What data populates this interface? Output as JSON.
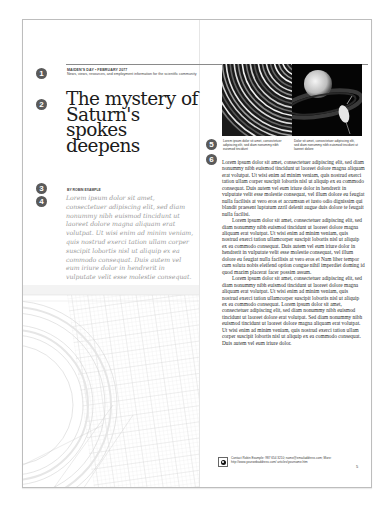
{
  "masthead": {
    "issue": "MAIDEN'S DAY • FEBRUARY 2077",
    "tagline": "News, views, resources, and employment information for the scientific community"
  },
  "article": {
    "title": "The mystery of Saturn's spokes deepens",
    "byline": "BY ROBIN EXAMPLE",
    "deck": "Lorem ipsum dolor sit amet, consectetuer adipiscing elit, sed diam nonummy nibh euismod tincidunt ut laoreet dolore magna aliquam erat volutpat. Ut wisi enim ad minim veniam, quis nostrud exerci tation ullam corper suscipit lobortis nisl ut aliquip ex ea commodo consequat. Duis autem vel eum iriure dolor in hendrerit in vulputate velit esse molestie consequat.",
    "body": [
      "Lorem ipsum dolor sit amet, consectetuer adipiscing elit, sed diam nonummy nibh euismod tincidunt ut laoreet dolore magna aliquam erat volutpat. Ut wisi enim ad minim veniam, quis nostrud exerci tation ullam corper suscipit lobortis nisl ut aliquip ex ea commodo consequat. Duis autem vel eum iriure dolor in hendrerit in vulputate velit esse molestie consequat, vel illum dolore eu feugiat nulla facilisis at vero eros et accumsan et iusto odio dignissim qui blandit praesent luptatum zzril delenit augue duis dolore te feugait nulla facilisi.",
      "Lorem ipsum dolor sit amet, consectetuer adipiscing elit, sed diam nonummy nibh euismod tincidunt ut laoreet dolore magna aliquam erat volutpat. Ut wisi enim ad minim veniam, quis nostrud exerci tation ullamcorper suscipit lobortis nisl ut aliquip ex ea commodo consequat. Duis autem vel eum iriure dolor in hendrerit in vulputate velit esse molestie consequat, vel illum dolore eu feugiat nulla facilisis at vero eros et Nam liber tempor cum soluta nobis eleifend option congue nihil imperdiet doming id quod mazim placerat facer possim assum.",
      "Lorem ipsum dolor sit amet, consectetuer adipiscing elit, sed diam nonummy nibh euismod tincidunt ut laoreet dolore magna aliquam erat volutpat. Ut wisi enim ad minim veniam, quis nostrud exerci tation ullamcorper suscipit lobortis nisl ut aliquip ex ea commodo consequat. Lorem ipsum dolor sit amet, consectetuer adipiscing elit, sed diam nonummy nibh euismod tincidunt ut laoreet dolore erat volutpat. Sed diam nonummy nibh euismod tincidunt ut laoreet dolore magna aliquam erat volutpat. Ut wisi enim ad minim veniam, quis nostrud exerci tation ullam corper suscipit lobortis nisl ut aliquip ex ea commodo consequat. Duis autem vel eum iriure dolor."
    ]
  },
  "figures": {
    "caption_left": "Lorem ipsum dolor sit amet, consectetuer adipiscing elit, sed diam nonummy nibh euismod tincidunt",
    "caption_right": "Dolor sit amet, consectetuer adipiscing elit, sed diam nonummy nibh euismod tincidunt ut laoreet dolore"
  },
  "callouts": [
    "1",
    "2",
    "3",
    "4",
    "5",
    "6"
  ],
  "footer": {
    "contact": "Contact Robin Example: 987 654 3210; name@emailaddress.com; More: http://www.yourwebaddress.com/ articles/yourname.htm",
    "page_number": "5"
  },
  "colors": {
    "badge": "#5a5a5a",
    "deck_text": "#9a9a9a",
    "frame": "#bdbdbd"
  }
}
